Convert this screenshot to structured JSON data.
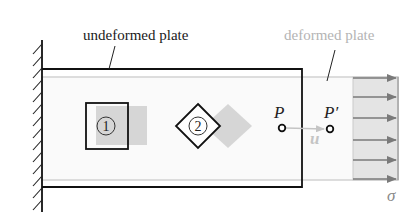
{
  "diagram": {
    "labels": {
      "undeformed": "undeformed plate",
      "deformed": "deformed plate"
    },
    "elements": {
      "element1": "1",
      "element2": "2"
    },
    "points": {
      "p": "P",
      "p_prime": "P′",
      "displacement": "u"
    },
    "stress": {
      "symbol": "σ",
      "arrow_count": 6
    },
    "colors": {
      "undeformed_stroke": "#111111",
      "deformed_stroke": "#c8c8c8",
      "deformed_fill": "#e6e6e6",
      "stress_fill": "#e4e4e4",
      "arrow": "#7a7a7a",
      "deformed_text": "#b4b4b4",
      "displacement": "#c4c4c4"
    }
  }
}
